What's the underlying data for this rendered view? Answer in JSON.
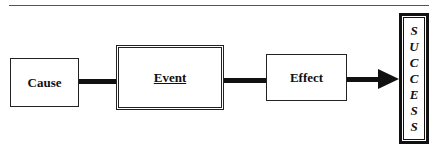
{
  "diagram": {
    "nodes": [
      {
        "id": "cause",
        "label": "Cause"
      },
      {
        "id": "event",
        "label": "Event"
      },
      {
        "id": "effect",
        "label": "Effect"
      },
      {
        "id": "success",
        "label": "SUCCESS",
        "letters": [
          "S",
          "U",
          "C",
          "C",
          "E",
          "S",
          "S"
        ]
      }
    ],
    "edges": [
      {
        "from": "cause",
        "to": "event",
        "arrow": false
      },
      {
        "from": "event",
        "to": "effect",
        "arrow": false
      },
      {
        "from": "effect",
        "to": "success",
        "arrow": true
      }
    ]
  }
}
